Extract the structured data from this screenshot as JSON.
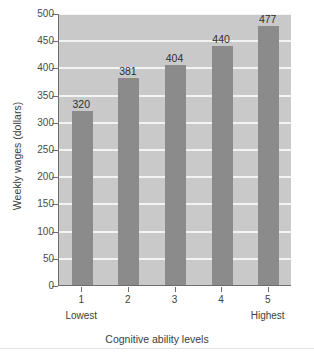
{
  "chart_data": {
    "type": "bar",
    "title": "",
    "xlabel": "Cognitive ability levels",
    "ylabel": "Weekly wages (dollars)",
    "categories": [
      "1",
      "2",
      "3",
      "4",
      "5"
    ],
    "category_sublabels": [
      "Lowest",
      "",
      "",
      "",
      "Highest"
    ],
    "values": [
      320,
      381,
      404,
      440,
      477
    ],
    "value_labels": [
      "320",
      "381",
      "404",
      "440",
      "477"
    ],
    "ylim": [
      0,
      500
    ],
    "ytick_labels": [
      "500",
      "450",
      "400",
      "350",
      "300",
      "250",
      "200",
      "150",
      "100",
      "50",
      "0"
    ],
    "ytick_values": [
      500,
      450,
      400,
      350,
      300,
      250,
      200,
      150,
      100,
      50,
      0
    ],
    "grid": true,
    "legend": "none",
    "colors": {
      "bar": "#8b8b8b",
      "plot_background": "#c9c9c9",
      "gridline": "#f3f3f3",
      "axis": "#6d6d6d",
      "text": "#3d3d3d",
      "figure_background": "#ffffff"
    }
  }
}
